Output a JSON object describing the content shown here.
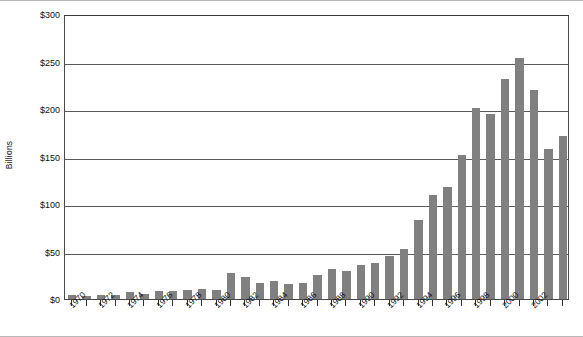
{
  "chart_data": {
    "type": "bar",
    "title": "",
    "subtitle": "",
    "xlabel": "",
    "ylabel": "Billions",
    "ylim": [
      0,
      300
    ],
    "ytick_values": [
      0,
      50,
      100,
      150,
      200,
      250,
      300
    ],
    "ytick_labels": [
      "$0",
      "$50",
      "$100",
      "$150",
      "$200",
      "$250",
      "$300"
    ],
    "grid": true,
    "legend": null,
    "bar_color": "#808080",
    "axis_color": "#4a4a4a",
    "categories": [
      "1970",
      "1971",
      "1972",
      "1973",
      "1974",
      "1975",
      "1976",
      "1977",
      "1978",
      "1979",
      "1980",
      "1981",
      "1982",
      "1983",
      "1984",
      "1985",
      "1986",
      "1987",
      "1988",
      "1989",
      "1990",
      "1991",
      "1992",
      "1993",
      "1994",
      "1995",
      "1996",
      "1997",
      "1998",
      "1999",
      "2000",
      "2001",
      "2002",
      "2003"
    ],
    "values": [
      4,
      3,
      4,
      4,
      7,
      5,
      8,
      8,
      9,
      11,
      10,
      27,
      23,
      17,
      19,
      16,
      17,
      25,
      32,
      29,
      36,
      38,
      45,
      53,
      83,
      110,
      118,
      152,
      201,
      195,
      232,
      254,
      220,
      158
    ],
    "xtick_labels_shown": [
      "1970",
      "1972",
      "1974",
      "1976",
      "1978",
      "1980",
      "1982",
      "1984",
      "1986",
      "1988",
      "1990",
      "1992",
      "1994",
      "1996",
      "1998",
      "2000",
      "2002"
    ]
  },
  "series_correction": {
    "values": [
      4,
      3,
      4,
      4,
      7,
      5,
      8,
      8,
      9,
      11,
      10,
      27,
      23,
      17,
      19,
      16,
      17,
      25,
      32,
      29,
      36,
      38,
      45,
      53,
      83,
      110,
      118,
      152,
      201,
      195,
      232,
      254,
      220,
      158,
      172
    ]
  }
}
